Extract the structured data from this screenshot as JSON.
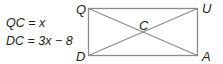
{
  "given": {
    "eq1": "QC = x",
    "eq2": "DC = 3x − 8"
  },
  "diagram": {
    "shape": "rectangle",
    "vertices": {
      "top_left": "Q",
      "top_right": "U",
      "bottom_left": "D",
      "bottom_right": "A",
      "center": "C"
    },
    "diagonals": [
      "QA",
      "DU"
    ],
    "stroke_color": "#8c8c8c"
  }
}
